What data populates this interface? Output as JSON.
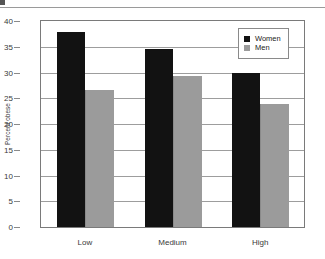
{
  "chart_data": {
    "type": "bar",
    "title": "",
    "xlabel": "",
    "ylabel": "Percent obese",
    "categories": [
      "Low",
      "Medium",
      "High"
    ],
    "series": [
      {
        "name": "Women",
        "color": "#121212",
        "values": [
          37.8,
          34.5,
          30.0
        ]
      },
      {
        "name": "Men",
        "color": "#9b9b9b",
        "values": [
          26.6,
          29.3,
          23.8
        ]
      }
    ],
    "ylim": [
      0,
      40
    ],
    "yticks": [
      0,
      5,
      10,
      15,
      20,
      25,
      30,
      35,
      40
    ],
    "ytick_labels": [
      "0",
      "5",
      "10",
      "15",
      "20",
      "25",
      "30",
      "35",
      "40"
    ],
    "grid": true,
    "legend_position": "top-right"
  },
  "legend": {
    "entries": [
      {
        "label": "Women",
        "color": "#121212"
      },
      {
        "label": "Men",
        "color": "#9b9b9b"
      }
    ]
  },
  "top_sliver": {
    "a": "cut",
    "b": "off",
    "c": "text"
  }
}
